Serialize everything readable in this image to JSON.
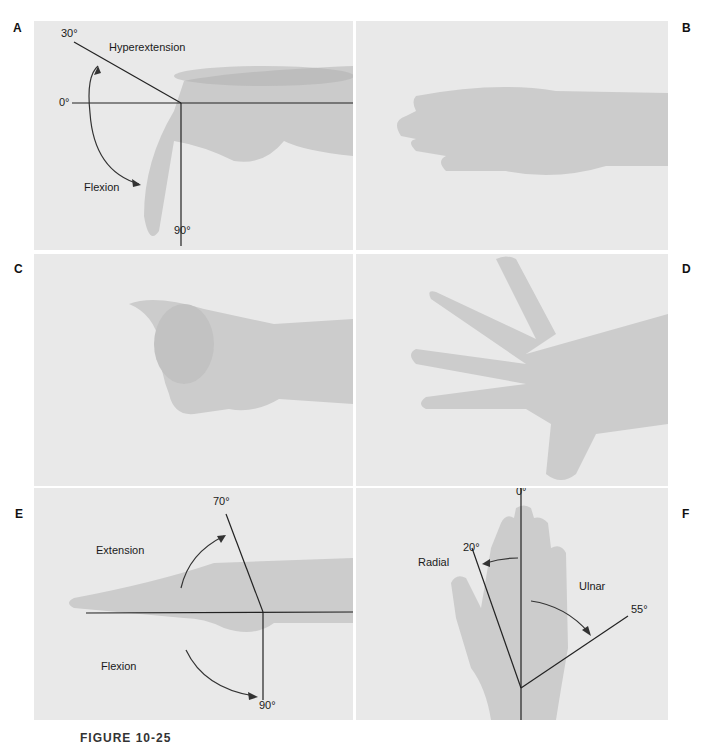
{
  "figure": {
    "caption": "FIGURE 10-25",
    "panels": [
      {
        "id": "A",
        "annotations": {
          "top_angle": "30°",
          "zero": "0°",
          "bottom_angle": "90°",
          "upper": "Hyperextension",
          "lower": "Flexion"
        }
      },
      {
        "id": "B",
        "annotations": {}
      },
      {
        "id": "C",
        "annotations": {}
      },
      {
        "id": "D",
        "annotations": {}
      },
      {
        "id": "E",
        "annotations": {
          "top_angle": "70°",
          "bottom_angle": "90°",
          "upper": "Extension",
          "lower": "Flexion"
        }
      },
      {
        "id": "F",
        "annotations": {
          "zero": "0°",
          "left_angle": "20°",
          "right_angle": "55°",
          "left": "Radial",
          "right": "Ulnar"
        }
      }
    ]
  },
  "colors": {
    "panel_bg": "#e9e9e9",
    "skin": "#c9c9c9",
    "line": "#222222"
  }
}
